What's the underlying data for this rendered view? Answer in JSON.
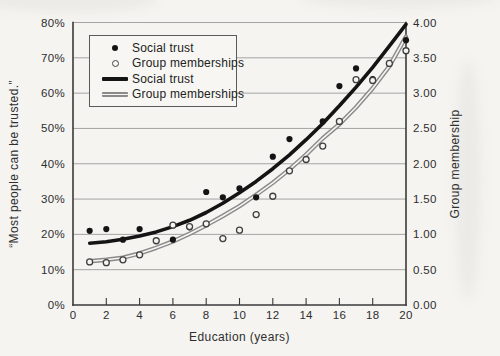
{
  "chart_data": {
    "type": "scatter",
    "title": "",
    "xlabel": "Education (years)",
    "ylabel_left": "“Most people can be trusted.”",
    "ylabel_right": "Group membership",
    "x_range": [
      0,
      20
    ],
    "x_ticks": [
      0,
      2,
      4,
      6,
      8,
      10,
      12,
      14,
      16,
      18,
      20
    ],
    "y_left_range_pct": [
      0,
      80
    ],
    "y_left_ticks": [
      "0%",
      "10%",
      "20%",
      "30%",
      "40%",
      "50%",
      "60%",
      "70%",
      "80%"
    ],
    "y_right_range": [
      0,
      4
    ],
    "y_right_ticks": [
      "0.00",
      "0.50",
      "1.00",
      "1.50",
      "2.00",
      "2.50",
      "3.00",
      "3.50",
      "4.00"
    ],
    "grid": true,
    "legend_position": "top-left",
    "series": [
      {
        "name": "Social trust",
        "type": "scatter",
        "marker": "filled-dot",
        "axis": "left",
        "points": [
          [
            1,
            21
          ],
          [
            2,
            21.5
          ],
          [
            3,
            18.5
          ],
          [
            4,
            21.5
          ],
          [
            6,
            18.5
          ],
          [
            7,
            22
          ],
          [
            8,
            32
          ],
          [
            9,
            30.5
          ],
          [
            10,
            33
          ],
          [
            11,
            30.5
          ],
          [
            12,
            42
          ],
          [
            13,
            47
          ],
          [
            15,
            52
          ],
          [
            16,
            62
          ],
          [
            17,
            67
          ],
          [
            18,
            64
          ],
          [
            20,
            75
          ]
        ]
      },
      {
        "name": "Group memberships",
        "type": "scatter",
        "marker": "open-circle",
        "axis": "right",
        "points": [
          [
            1,
            0.61
          ],
          [
            2,
            0.6
          ],
          [
            3,
            0.64
          ],
          [
            4,
            0.71
          ],
          [
            5,
            0.91
          ],
          [
            6,
            1.13
          ],
          [
            7,
            1.11
          ],
          [
            8,
            1.15
          ],
          [
            9,
            0.94
          ],
          [
            10,
            1.06
          ],
          [
            11,
            1.28
          ],
          [
            12,
            1.54
          ],
          [
            13,
            1.9
          ],
          [
            14,
            2.06
          ],
          [
            15,
            2.25
          ],
          [
            16,
            2.6
          ],
          [
            17,
            3.19
          ],
          [
            18,
            3.18
          ],
          [
            19,
            3.42
          ],
          [
            20,
            3.6
          ]
        ]
      },
      {
        "name": "Social trust",
        "type": "line",
        "style": "thick-black",
        "axis": "left",
        "points": [
          [
            1,
            17.5
          ],
          [
            2,
            17.9
          ],
          [
            3,
            18.6
          ],
          [
            4,
            19.5
          ],
          [
            5,
            20.7
          ],
          [
            6,
            22.2
          ],
          [
            7,
            24
          ],
          [
            8,
            26.2
          ],
          [
            9,
            28.8
          ],
          [
            10,
            31.8
          ],
          [
            11,
            35
          ],
          [
            12,
            38.6
          ],
          [
            13,
            42.5
          ],
          [
            14,
            46.8
          ],
          [
            15,
            51.4
          ],
          [
            16,
            56.4
          ],
          [
            17,
            61.7
          ],
          [
            18,
            67.3
          ],
          [
            19,
            73.3
          ],
          [
            20,
            79.5
          ]
        ]
      },
      {
        "name": "Group memberships",
        "type": "line",
        "style": "double-gray",
        "axis": "right",
        "points": [
          [
            1,
            0.62
          ],
          [
            2,
            0.64
          ],
          [
            3,
            0.67
          ],
          [
            4,
            0.73
          ],
          [
            5,
            0.81
          ],
          [
            6,
            0.9
          ],
          [
            7,
            1.01
          ],
          [
            8,
            1.13
          ],
          [
            9,
            1.26
          ],
          [
            10,
            1.4
          ],
          [
            11,
            1.56
          ],
          [
            12,
            1.73
          ],
          [
            13,
            1.92
          ],
          [
            14,
            2.13
          ],
          [
            15,
            2.36
          ],
          [
            16,
            2.56
          ],
          [
            17,
            2.8
          ],
          [
            18,
            3.07
          ],
          [
            19,
            3.38
          ],
          [
            20,
            3.8
          ]
        ]
      }
    ]
  },
  "legend": {
    "items": [
      {
        "label": "Social trust",
        "marker": "filled-dot"
      },
      {
        "label": "Group memberships",
        "marker": "open-circle"
      },
      {
        "label": "Social trust",
        "marker": "thick-black"
      },
      {
        "label": "Group memberships",
        "marker": "double-gray"
      }
    ]
  },
  "colors": {
    "background": "#f5f4f1",
    "trust_line": "#141414",
    "membership_line_gray": "#8a8a8a",
    "grid": "#9b9b9b",
    "spine": "#3a3a3a",
    "text": "#2e2e2e",
    "open_circle_stroke": "#3f3f3f"
  }
}
